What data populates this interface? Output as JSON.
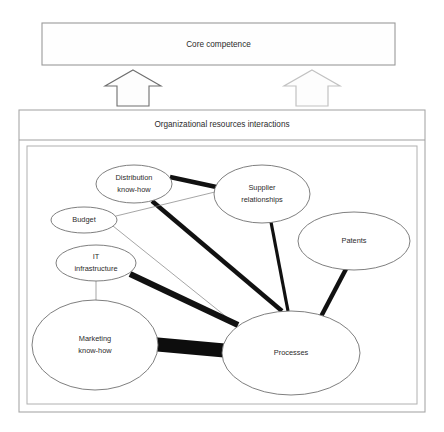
{
  "diagram": {
    "type": "layered-block-and-network",
    "top_box": {
      "label": "Core competence",
      "x": 42,
      "y": 23,
      "w": 353,
      "h": 42
    },
    "arrows": [
      {
        "name": "arrow-left",
        "label": "",
        "x": 105,
        "y": 70,
        "w": 56,
        "h": 36,
        "style": "dark-outline"
      },
      {
        "name": "arrow-right",
        "label": "",
        "x": 284,
        "y": 70,
        "w": 56,
        "h": 36,
        "style": "light-outline"
      }
    ],
    "bottom_panel": {
      "label": "Organizational resources interactions",
      "x": 19,
      "y": 110,
      "w": 406,
      "h": 302,
      "header_height": 30,
      "inner_x": 27,
      "inner_y": 146,
      "inner_w": 390,
      "inner_h": 258
    },
    "nodes": [
      {
        "id": "distribution",
        "label": "Distribution know-how",
        "line1": "Distribution",
        "line2": "know-how",
        "cx": 134,
        "cy": 184,
        "rx": 38,
        "ry": 19
      },
      {
        "id": "supplier",
        "label": "Supplier relationships",
        "line1": "Supplier",
        "line2": "relationships",
        "cx": 262,
        "cy": 194,
        "rx": 48,
        "ry": 29
      },
      {
        "id": "patents",
        "label": "Patents",
        "line1": "Patents",
        "line2": "",
        "cx": 354,
        "cy": 241,
        "rx": 56,
        "ry": 29
      },
      {
        "id": "budget",
        "label": "Budget",
        "line1": "Budget",
        "line2": "",
        "cx": 84,
        "cy": 220,
        "rx": 33,
        "ry": 13
      },
      {
        "id": "it",
        "label": "IT infrastructure",
        "line1": "IT",
        "line2": "infrastructure",
        "cx": 96,
        "cy": 263,
        "rx": 40,
        "ry": 18
      },
      {
        "id": "marketing",
        "label": "Marketing know-how",
        "line1": "Marketing",
        "line2": "know-how",
        "cx": 95,
        "cy": 345,
        "rx": 63,
        "ry": 45
      },
      {
        "id": "processes",
        "label": "Processes",
        "line1": "Processes",
        "line2": "",
        "cx": 291,
        "cy": 353,
        "rx": 69,
        "ry": 42
      }
    ],
    "edges": [
      {
        "from": "distribution",
        "to": "supplier",
        "weight": "thick",
        "x1": 170,
        "y1": 177,
        "x2": 221,
        "y2": 188
      },
      {
        "from": "distribution",
        "to": "processes",
        "weight": "thick",
        "x1": 152,
        "y1": 201,
        "x2": 282,
        "y2": 311
      },
      {
        "from": "budget",
        "to": "supplier",
        "weight": "hair",
        "x1": 116,
        "y1": 216,
        "x2": 219,
        "y2": 191
      },
      {
        "from": "budget",
        "to": "processes",
        "weight": "hair",
        "x1": 113,
        "y1": 226,
        "x2": 239,
        "y2": 327
      },
      {
        "from": "it",
        "to": "processes",
        "weight": "xthick",
        "x1": 130,
        "y1": 274,
        "x2": 238,
        "y2": 325
      },
      {
        "from": "it",
        "to": "marketing",
        "weight": "hair",
        "x1": 96,
        "y1": 281,
        "x2": 96,
        "y2": 300
      },
      {
        "from": "marketing",
        "to": "processes",
        "weight": "band",
        "x1": 152,
        "y1": 344,
        "x2": 230,
        "y2": 351
      },
      {
        "from": "supplier",
        "to": "processes",
        "weight": "med",
        "x1": 271,
        "y1": 222,
        "x2": 288,
        "y2": 311
      },
      {
        "from": "patents",
        "to": "processes",
        "weight": "thick",
        "x1": 346,
        "y1": 269,
        "x2": 316,
        "y2": 326
      }
    ]
  }
}
